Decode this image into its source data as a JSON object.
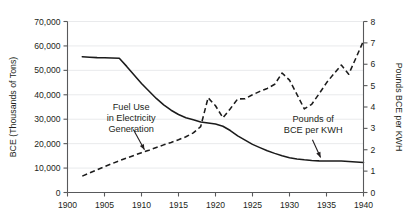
{
  "chart_data": {
    "type": "line",
    "title": "",
    "subtitle": "",
    "xlabel": "",
    "ylabel": "BCE (Thousands of Tons)",
    "y2label": "Pounds BCE per KWH",
    "xlim": [
      1900,
      1940
    ],
    "ylim": [
      0,
      70000
    ],
    "y2lim": [
      0,
      8
    ],
    "grid": "horizontal",
    "legend": "none (inline annotations)",
    "x_ticks": [
      "1900",
      "1905",
      "1910",
      "1915",
      "1920",
      "1925",
      "1930",
      "1935",
      "1940"
    ],
    "x_tick_values": [
      1900,
      1905,
      1910,
      1915,
      1920,
      1925,
      1930,
      1935,
      1940
    ],
    "y_ticks": [
      "0",
      "10,000",
      "20,000",
      "30,000",
      "40,000",
      "50,000",
      "60,000",
      "70,000"
    ],
    "y_tick_values": [
      0,
      10000,
      20000,
      30000,
      40000,
      50000,
      60000,
      70000
    ],
    "y2_ticks": [
      "0",
      "1",
      "2",
      "3",
      "4",
      "5",
      "6",
      "7",
      "8"
    ],
    "y2_tick_values": [
      0,
      1,
      2,
      3,
      4,
      5,
      6,
      7,
      8
    ],
    "series": [
      {
        "name": "Fuel Use in Electricity Generation",
        "axis": "left",
        "style": "dashed",
        "color": "#1b1b1b",
        "units": "BCE (Thousands of Tons)",
        "x": [
          1902,
          1903,
          1904,
          1905,
          1906,
          1907,
          1908,
          1909,
          1910,
          1911,
          1912,
          1913,
          1914,
          1915,
          1916,
          1917,
          1918,
          1919,
          1920,
          1921,
          1922,
          1923,
          1924,
          1925,
          1926,
          1927,
          1928,
          1929,
          1930,
          1931,
          1932,
          1933,
          1934,
          1935,
          1936,
          1937,
          1938,
          1939,
          1940
        ],
        "values": [
          6700,
          8000,
          9300,
          10600,
          11800,
          13000,
          14100,
          15200,
          16300,
          17300,
          18400,
          19500,
          20500,
          21600,
          22800,
          24400,
          27000,
          38800,
          35500,
          30600,
          34300,
          38300,
          38400,
          40000,
          41400,
          42600,
          44300,
          48900,
          46000,
          40200,
          34200,
          36100,
          40400,
          44900,
          48600,
          52200,
          48400,
          55200,
          62100
        ]
      },
      {
        "name": "Pounds of BCE per KWH",
        "axis": "right",
        "style": "solid",
        "color": "#1b1b1b",
        "units": "Pounds BCE per KWH",
        "x": [
          1902,
          1903,
          1904,
          1905,
          1906,
          1907,
          1908,
          1909,
          1910,
          1911,
          1912,
          1913,
          1914,
          1915,
          1916,
          1917,
          1918,
          1919,
          1920,
          1921,
          1922,
          1923,
          1924,
          1925,
          1926,
          1927,
          1928,
          1929,
          1930,
          1931,
          1932,
          1933,
          1934,
          1935,
          1936,
          1937,
          1938,
          1939,
          1940
        ],
        "values": [
          6.35,
          6.33,
          6.31,
          6.3,
          6.29,
          6.28,
          5.9,
          5.5,
          5.1,
          4.75,
          4.4,
          4.1,
          3.85,
          3.65,
          3.5,
          3.4,
          3.3,
          3.25,
          3.2,
          3.1,
          2.9,
          2.65,
          2.45,
          2.25,
          2.1,
          1.95,
          1.83,
          1.72,
          1.63,
          1.57,
          1.53,
          1.5,
          1.48,
          1.47,
          1.47,
          1.47,
          1.45,
          1.43,
          1.4
        ]
      }
    ],
    "annotations": [
      {
        "id": "fuel-use-annotation",
        "lines": [
          "Fuel Use",
          "in Electricity",
          "Generation"
        ],
        "text_x": 1908.6,
        "text_y": 33800,
        "arrow_from_x": 1908.9,
        "arrow_from_y": 25800,
        "arrow_to_x": 1910.4,
        "arrow_to_y": 17500
      },
      {
        "id": "bce-per-kwh-annotation",
        "lines": [
          "Pounds of",
          "BCE per KWH"
        ],
        "text_x": 1933.2,
        "text_y": 28900,
        "arrow_from_x": 1933.1,
        "arrow_from_y": 21600,
        "arrow_to_x": 1934.2,
        "arrow_to_y": 14300
      }
    ]
  }
}
